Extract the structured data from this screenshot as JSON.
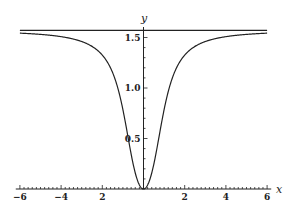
{
  "chart_data": {
    "type": "line",
    "title": "",
    "xlabel": "x",
    "ylabel": "y",
    "xlim": [
      -6,
      6
    ],
    "ylim": [
      0,
      1.6
    ],
    "grid": false,
    "legend": null,
    "x_ticks": [
      -6,
      -4,
      -2,
      2,
      4,
      6
    ],
    "x_tick_labels": [
      "−6",
      "−4",
      "2",
      "2",
      "4",
      "6"
    ],
    "y_ticks": [
      0.5,
      1.0,
      1.5
    ],
    "y_tick_labels": [
      "0.5",
      "1.0",
      "1.5"
    ],
    "series": [
      {
        "name": "y = arctan(x^2)",
        "x": [
          -6,
          -5,
          -4,
          -3,
          -2,
          -1.5,
          -1,
          -0.5,
          0,
          0.5,
          1,
          1.5,
          2,
          3,
          4,
          5,
          6
        ],
        "values": [
          1.543,
          1.531,
          1.508,
          1.46,
          1.326,
          1.153,
          0.785,
          0.245,
          0.0,
          0.245,
          0.785,
          1.153,
          1.326,
          1.46,
          1.508,
          1.531,
          1.543
        ]
      },
      {
        "name": "asymptote y = π/2",
        "x": [
          -6,
          6
        ],
        "values": [
          1.5708,
          1.5708
        ]
      }
    ]
  },
  "axes": {
    "x_label": "x",
    "y_label": "y",
    "x_tick_labels": [
      "−6",
      "−4",
      "2",
      "2",
      "4",
      "6"
    ],
    "y_tick_labels": [
      "0.5",
      "1.0",
      "1.5"
    ]
  }
}
